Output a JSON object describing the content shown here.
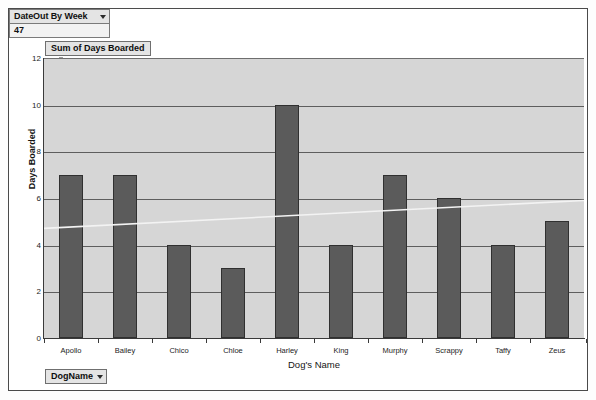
{
  "page_filter": {
    "label": "DateOut By Week",
    "value": "47",
    "caret_icon": "chevron-down-icon"
  },
  "series_label": "Sum of Days Boarded",
  "field_button": {
    "label": "DogName",
    "caret_icon": "chevron-down-icon"
  },
  "colors": {
    "bar_fill": "#5b5b5b",
    "bar_stroke": "#303030",
    "plot_background": "#d6d6d6",
    "gridline": "#5e5e5e",
    "axis": "#3a3a3a",
    "control_background": "#e4e4e4",
    "frame_border": "#4a4a4a"
  },
  "chart_data": {
    "type": "bar",
    "title": "Sum of Days Boarded",
    "xlabel": "Dog's Name",
    "ylabel": "Days Boarded",
    "categories": [
      "Apollo",
      "Bailey",
      "Chico",
      "Chloe",
      "Harley",
      "King",
      "Murphy",
      "Scrappy",
      "Taffy",
      "Zeus"
    ],
    "values": [
      7,
      7,
      4,
      3,
      10,
      4,
      7,
      6,
      4,
      5
    ],
    "ylim": [
      0,
      12
    ],
    "yticks": [
      0,
      2,
      4,
      6,
      8,
      10,
      12
    ],
    "grid": true,
    "legend": "none",
    "series": [
      {
        "name": "Sum of Days Boarded",
        "values": [
          7,
          7,
          4,
          3,
          10,
          4,
          7,
          6,
          4,
          5
        ]
      }
    ]
  }
}
